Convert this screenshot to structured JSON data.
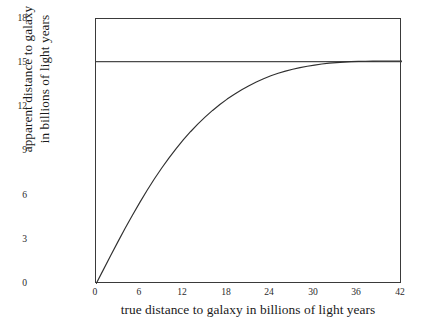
{
  "chart_data": {
    "type": "line",
    "title": "",
    "xlabel": "true distance to galaxy in billions of light years",
    "ylabel_line1": "apparent distance to galaxy",
    "ylabel_line2": "in billions of light years",
    "xlim": [
      0,
      42
    ],
    "ylim": [
      0,
      18
    ],
    "xticks": [
      0,
      6,
      12,
      18,
      24,
      30,
      36,
      42
    ],
    "yticks": [
      0,
      3,
      6,
      9,
      12,
      15,
      18
    ],
    "xtick_labels": [
      "0",
      "6",
      "12",
      "18",
      "24",
      "30",
      "36",
      "42"
    ],
    "ytick_labels": [
      "0",
      "3",
      "6",
      "9",
      "12",
      "15",
      "18"
    ],
    "grid": false,
    "legend": null,
    "line_color": "#303030",
    "asymptote_color": "#4a4a4a",
    "frame_color": "#3a3a3a",
    "background": "#ffffff",
    "series": [
      {
        "name": "apparent distance",
        "x": [
          0,
          1,
          2,
          3,
          4,
          5,
          6,
          7,
          8,
          9,
          10,
          11,
          12,
          13,
          14,
          15,
          16,
          17,
          18,
          19,
          20,
          21,
          22,
          23,
          24,
          25,
          26,
          27,
          28,
          29,
          30,
          31,
          32,
          33,
          34,
          35,
          36,
          37,
          38,
          39,
          40,
          41,
          42
        ],
        "y": [
          0,
          0.96,
          1.92,
          2.86,
          3.78,
          4.67,
          5.53,
          6.35,
          7.13,
          7.86,
          8.55,
          9.2,
          9.8,
          10.36,
          10.88,
          11.35,
          11.79,
          12.19,
          12.56,
          12.89,
          13.19,
          13.47,
          13.72,
          13.94,
          14.14,
          14.31,
          14.46,
          14.59,
          14.7,
          14.79,
          14.87,
          14.94,
          15.0,
          15.04,
          15.07,
          15.1,
          15.12,
          15.13,
          15.14,
          15.15,
          15.15,
          15.15,
          15.15
        ]
      },
      {
        "name": "asymptote",
        "type": "hline",
        "y_value": 15.1,
        "x": [
          0,
          42
        ],
        "y": [
          15.1,
          15.1
        ]
      }
    ],
    "annotations": [
      {
        "text": "horizontal asymptote at apparent distance 15 billion light years",
        "y": 15
      }
    ]
  }
}
